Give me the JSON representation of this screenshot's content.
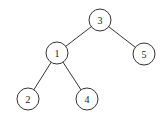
{
  "diagram": {
    "type": "binary-tree",
    "nodes": [
      {
        "id": "n3",
        "label": "3",
        "x": 100,
        "y": 20
      },
      {
        "id": "n1",
        "label": "1",
        "x": 57,
        "y": 53
      },
      {
        "id": "n5",
        "label": "5",
        "x": 144,
        "y": 54
      },
      {
        "id": "n2",
        "label": "2",
        "x": 28,
        "y": 99
      },
      {
        "id": "n4",
        "label": "4",
        "x": 87,
        "y": 99
      }
    ],
    "edges": [
      {
        "from": "n3",
        "to": "n1"
      },
      {
        "from": "n3",
        "to": "n5"
      },
      {
        "from": "n1",
        "to": "n2"
      },
      {
        "from": "n1",
        "to": "n4"
      }
    ],
    "node_radius": 11
  }
}
